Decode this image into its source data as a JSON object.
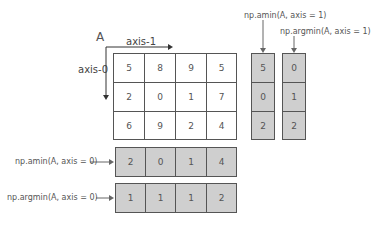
{
  "matrix_name": "A",
  "axis1_label": "axis-1",
  "axis0_label": "axis-0",
  "matrix": [
    [
      "5",
      "8",
      "9",
      "5"
    ],
    [
      "2",
      "0",
      "1",
      "7"
    ],
    [
      "6",
      "9",
      "2",
      "4"
    ]
  ],
  "amin_axis1": {
    "label": "np.amin(A, axis = 1)",
    "values": [
      "5",
      "0",
      "2"
    ]
  },
  "argmin_axis1": {
    "label": "np.argmin(A, axis = 1)",
    "values": [
      "0",
      "1",
      "2"
    ]
  },
  "amin_axis0": {
    "label": "np.amin(A, axis = 0)",
    "values": [
      "2",
      "0",
      "1",
      "4"
    ]
  },
  "argmin_axis0": {
    "label": "np.argmin(A, axis = 0)",
    "values": [
      "1",
      "1",
      "1",
      "2"
    ]
  }
}
